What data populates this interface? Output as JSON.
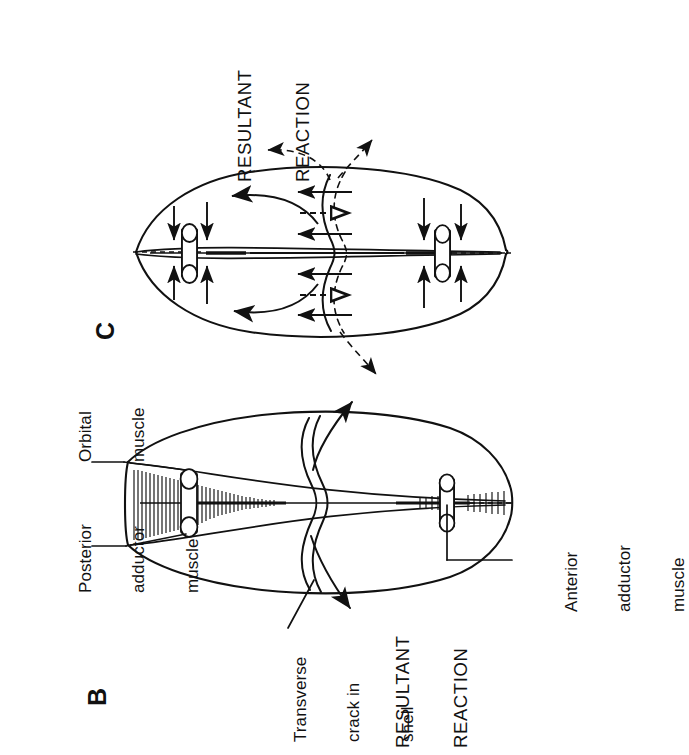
{
  "figure": {
    "orientation": "rotated-90-ccw",
    "background_color": "#ffffff",
    "ink_color": "#111111",
    "panels": [
      {
        "id": "C",
        "letter": "C",
        "description": "Shell with transverse crack showing compressive closing forces and resultant reaction"
      },
      {
        "id": "B",
        "letter": "B",
        "description": "Shell with transverse crack, labelled musculature and resultant reaction"
      }
    ]
  },
  "panel_c": {
    "letter": "C",
    "resultant_reaction": "RESULTANT\nREACTION",
    "resultant_line_1": "RESULTANT",
    "resultant_line_2": "REACTION"
  },
  "panel_b": {
    "letter": "B",
    "labels": {
      "orbital_muscle": "Orbital\nmuscle",
      "orbital_muscle_line_1": "Orbital",
      "orbital_muscle_line_2": "muscle",
      "posterior_adductor_muscle": "Posterior\nadductor\nmuscle",
      "posterior_line_1": "Posterior",
      "posterior_line_2": "adductor",
      "posterior_line_3": "muscle",
      "anterior_adductor_muscle": "Anterior\nadductor\nmuscle",
      "anterior_line_1": "Anterior",
      "anterior_line_2": "adductor",
      "anterior_line_3": "muscle",
      "transverse_crack": "Transverse\ncrack in\nshell",
      "transverse_line_1": "Transverse",
      "transverse_line_2": "crack in",
      "transverse_line_3": "shell",
      "resultant_reaction": "RESULTANT\nREACTION",
      "resultant_line_1": "RESULTANT",
      "resultant_line_2": "REACTION"
    }
  },
  "icons": {
    "closing_force_arrow": "down-arrow-icon",
    "opening_force_arrow": "up-arrow-icon",
    "flow_arrow": "curved-arrow-icon",
    "open_arrow": "hollow-arrow-icon",
    "resultant_arrow": "dashed-arrow-icon"
  }
}
